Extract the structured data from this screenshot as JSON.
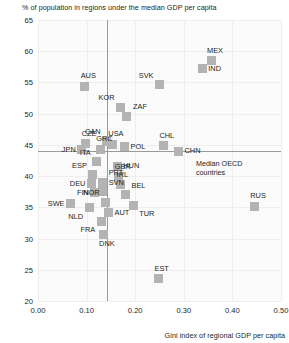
{
  "chart_data": {
    "type": "scatter",
    "title": "",
    "ylabel": "% of population in regions under the median GDP per capita",
    "xlabel": "Gini index of regional GDP per capita",
    "xlim": [
      0.0,
      0.5
    ],
    "ylim": [
      20,
      65
    ],
    "grid": true,
    "legend": "none",
    "xticks": [
      "0.00",
      "0.10",
      "0.20",
      "0.30",
      "0.40",
      "0.50"
    ],
    "xtick_values": [
      0.0,
      0.1,
      0.2,
      0.3,
      0.4,
      0.5
    ],
    "yticks": [
      "20",
      "25",
      "30",
      "35",
      "40",
      "45",
      "50",
      "55",
      "60",
      "65"
    ],
    "ytick_values": [
      20,
      25,
      30,
      35,
      40,
      45,
      50,
      55,
      60,
      65
    ],
    "reference_lines": [
      {
        "name": "median-oecd-horizontal",
        "orientation": "horizontal",
        "value": 44.0,
        "annotation": "Median OECD countries"
      },
      {
        "name": "median-oecd-vertical",
        "orientation": "vertical",
        "value": 0.141,
        "annotation": ""
      }
    ],
    "annotations": [
      {
        "text": "Median OECD",
        "line": 1
      },
      {
        "text": "countries",
        "line": 2
      }
    ],
    "points": [
      {
        "label": "MEX",
        "x": 0.356,
        "y": 58.5,
        "pos": "n"
      },
      {
        "label": "IND",
        "x": 0.338,
        "y": 57.2,
        "pos": "e"
      },
      {
        "label": "SVK",
        "x": 0.25,
        "y": 54.6,
        "pos": "nw"
      },
      {
        "label": "AUS",
        "x": 0.096,
        "y": 54.4,
        "pos": "n"
      },
      {
        "label": "KOR",
        "x": 0.17,
        "y": 51.0,
        "pos": "nw"
      },
      {
        "label": "ZAF",
        "x": 0.183,
        "y": 49.6,
        "pos": "ne"
      },
      {
        "label": "CAN",
        "x": 0.141,
        "y": 45.6,
        "pos": "nw"
      },
      {
        "label": "USA",
        "x": 0.153,
        "y": 45.1,
        "pos": "n"
      },
      {
        "label": "POL",
        "x": 0.178,
        "y": 44.7,
        "pos": "e"
      },
      {
        "label": "CHL",
        "x": 0.258,
        "y": 44.9,
        "pos": "n"
      },
      {
        "label": "CZE",
        "x": 0.098,
        "y": 45.2,
        "pos": "n"
      },
      {
        "label": "GRC",
        "x": 0.128,
        "y": 44.3,
        "pos": "n"
      },
      {
        "label": "JPN",
        "x": 0.09,
        "y": 44.2,
        "pos": "w"
      },
      {
        "label": "CHN",
        "x": 0.289,
        "y": 44.0,
        "pos": "e"
      },
      {
        "label": "ITA",
        "x": 0.121,
        "y": 42.3,
        "pos": "nw"
      },
      {
        "label": "HUN",
        "x": 0.163,
        "y": 41.6,
        "pos": "e"
      },
      {
        "label": "ESP",
        "x": 0.113,
        "y": 40.2,
        "pos": "nw"
      },
      {
        "label": "GBR",
        "x": 0.166,
        "y": 39.8,
        "pos": "n"
      },
      {
        "label": "PRT",
        "x": 0.133,
        "y": 39.0,
        "pos": "ne"
      },
      {
        "label": "DEU",
        "x": 0.11,
        "y": 38.8,
        "pos": "w"
      },
      {
        "label": "IRL",
        "x": 0.17,
        "y": 38.6,
        "pos": "n"
      },
      {
        "label": "SVN",
        "x": 0.133,
        "y": 37.5,
        "pos": "ne"
      },
      {
        "label": "FIN",
        "x": 0.117,
        "y": 37.3,
        "pos": "w"
      },
      {
        "label": "BEL",
        "x": 0.18,
        "y": 37.0,
        "pos": "ne"
      },
      {
        "label": "SWE",
        "x": 0.067,
        "y": 35.6,
        "pos": "w"
      },
      {
        "label": "RUS",
        "x": 0.445,
        "y": 35.2,
        "pos": "n"
      },
      {
        "label": "NOR",
        "x": 0.139,
        "y": 35.8,
        "pos": "nw"
      },
      {
        "label": "NLD",
        "x": 0.105,
        "y": 34.9,
        "pos": "sw"
      },
      {
        "label": "TUR",
        "x": 0.196,
        "y": 35.3,
        "pos": "se"
      },
      {
        "label": "AUT",
        "x": 0.145,
        "y": 34.1,
        "pos": "e"
      },
      {
        "label": "FRA",
        "x": 0.13,
        "y": 32.8,
        "pos": "sw"
      },
      {
        "label": "DNK",
        "x": 0.134,
        "y": 30.7,
        "pos": "s"
      },
      {
        "label": "EST",
        "x": 0.248,
        "y": 23.6,
        "pos": "n"
      }
    ],
    "colors": {
      "marker": "#b3b3b3",
      "plot_background": "#fbfbfb",
      "gridline": "#eeeeee",
      "reference_line": "#9a9a9a",
      "text": "#231f20"
    }
  }
}
